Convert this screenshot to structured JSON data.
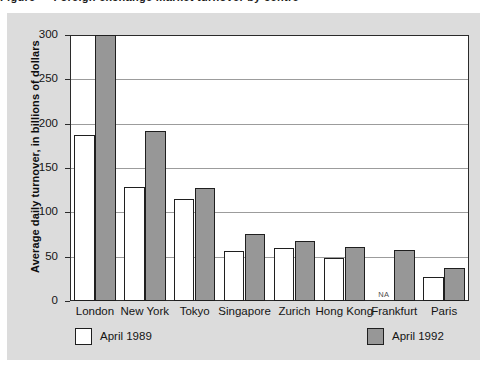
{
  "figure": {
    "cutoff_caption": "Figure  —  Foreign exchange market turnover by centre",
    "panel_background": "#dcdcdc",
    "plot_background": "#ffffff"
  },
  "chart_data": {
    "type": "bar",
    "title": "",
    "subtitle": "",
    "xlabel": "",
    "ylabel": "Average daily turnover, in billions of dollars",
    "ylim": [
      0,
      300
    ],
    "yticks": [
      0,
      50,
      100,
      150,
      200,
      250,
      300
    ],
    "ytick_labels": [
      "0",
      "50",
      "100",
      "150",
      "200",
      "250",
      "300"
    ],
    "grid": true,
    "grid_axis": "y",
    "legend_position": "below-plot",
    "categories": [
      "London",
      "New York",
      "Tokyo",
      "Singapore",
      "Zurich",
      "Hong Kong",
      "Frankfurt",
      "Paris"
    ],
    "series": [
      {
        "name": "April 1989",
        "color": "#ffffff",
        "edge_color": "#1f1f1f",
        "values": [
          187,
          129,
          115,
          56,
          60,
          49,
          null,
          27
        ],
        "null_label": "NA"
      },
      {
        "name": "April 1992",
        "color": "#979797",
        "edge_color": "#1f1f1f",
        "values": [
          300,
          192,
          128,
          76,
          68,
          61,
          58,
          37
        ]
      }
    ],
    "annotations": [
      {
        "text": "NA",
        "category": "Frankfurt",
        "series": "April 1989"
      }
    ]
  },
  "legend": {
    "items": [
      {
        "label": "April 1989",
        "color": "#ffffff"
      },
      {
        "label": "April 1992",
        "color": "#979797"
      }
    ]
  }
}
